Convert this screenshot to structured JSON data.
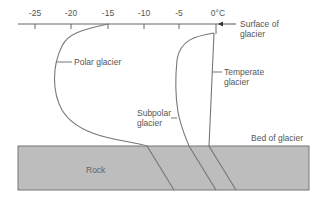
{
  "axis": {
    "ticks": [
      {
        "label": "-25",
        "x": 35
      },
      {
        "label": "-20",
        "x": 71
      },
      {
        "label": "-15",
        "x": 108
      },
      {
        "label": "-10",
        "x": 144
      },
      {
        "label": "-5",
        "x": 179
      },
      {
        "label": "0°C",
        "x": 216
      }
    ],
    "line_color": "#666666"
  },
  "labels": {
    "surface_line1": "Surface of",
    "surface_line2": "glacier",
    "polar": "Polar glacier",
    "subpolar_line1": "Subpolar",
    "subpolar_line2": "glacier",
    "temperate_line1": "Temperate",
    "temperate_line2": "glacier",
    "bed": "Bed of glacier",
    "rock": "Rock"
  },
  "colors": {
    "rock_fill": "#bdbdbd",
    "curve": "#777777"
  }
}
